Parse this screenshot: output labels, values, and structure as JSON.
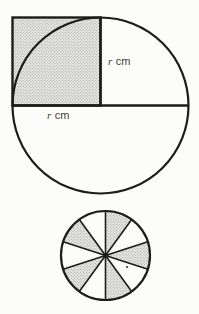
{
  "page": {
    "background": "#fcfcfb"
  },
  "diagram": {
    "top_figure": {
      "type": "circle-with-shaded-square-on-upper-left-quadrant",
      "labels": {
        "vertical_radius": {
          "symbol": "r",
          "unit": "cm"
        },
        "horizontal_radius": {
          "symbol": "r",
          "unit": "cm"
        }
      },
      "shading": "halftone-stipple"
    },
    "bottom_figure": {
      "type": "circle-divided-into-equal-sectors",
      "sector_count": 10,
      "sector_angle_deg": 36,
      "shaded_sector_indices": [
        1,
        3,
        5,
        7,
        9
      ],
      "shading": "halftone-stipple"
    },
    "colors": {
      "line": "#1c1c1c",
      "label_text": "#3f3f3f",
      "halftone_base": "#e7e7e6",
      "halftone_dot": "#989898"
    }
  }
}
